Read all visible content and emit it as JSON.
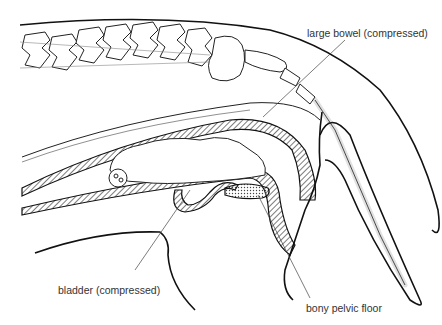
{
  "diagram": {
    "type": "anatomical cross-section",
    "labels": {
      "large_bowel": "large bowel (compressed)",
      "bladder": "bladder (compressed)",
      "pelvic_floor": "bony pelvic floor"
    },
    "colors": {
      "line": "#111111",
      "leader": "#444444",
      "label_text": "#333333",
      "background": "#ffffff"
    }
  }
}
